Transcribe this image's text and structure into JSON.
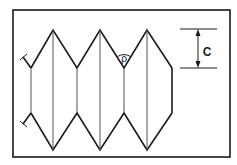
{
  "figure": {
    "labels": {
      "angle_symbol": "ρ",
      "dimension_label": "C"
    },
    "colors": {
      "line": "#1a1a1a",
      "background": "#ffffff"
    }
  }
}
